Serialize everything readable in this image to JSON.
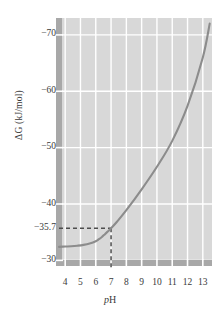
{
  "chart_data": {
    "type": "line",
    "title": "",
    "xlabel": "pH",
    "ylabel": "ΔG (kJ/mol)",
    "xlim": [
      3.4,
      13.6
    ],
    "ylim": [
      -29.0,
      -73.0
    ],
    "grid": true,
    "legend": null,
    "x_ticks": [
      4,
      5,
      6,
      7,
      8,
      9,
      10,
      11,
      12,
      13
    ],
    "x_tick_labels": [
      "4",
      "5",
      "6",
      "7",
      "8",
      "9",
      "10",
      "11",
      "12",
      "13"
    ],
    "y_ticks": [
      -70,
      -60,
      -50,
      -40,
      -35.7,
      -30
    ],
    "y_tick_labels": [
      "−70",
      "−60",
      "−50",
      "−40",
      "−35.7",
      "−30"
    ],
    "series": [
      {
        "name": "ΔG vs pH",
        "color": "#8c8c8c",
        "x": [
          3.6,
          4.0,
          4.4,
          4.8,
          5.2,
          5.6,
          6.0,
          6.2,
          6.4,
          6.6,
          6.8,
          7.0,
          7.4,
          8.0,
          9.0,
          10.0,
          11.0,
          12.0,
          13.0,
          13.45
        ],
        "y": [
          -32.4,
          -32.45,
          -32.5,
          -32.6,
          -32.75,
          -33.0,
          -33.4,
          -33.75,
          -34.15,
          -34.65,
          -35.15,
          -35.7,
          -36.9,
          -38.9,
          -42.6,
          -46.6,
          -51.2,
          -57.4,
          -66.0,
          -72.0
        ]
      }
    ],
    "annotations": [
      {
        "name": "ph7-marker",
        "type": "dashed-crosshair",
        "x": 7,
        "y": -35.7,
        "label": "−35.7",
        "color": "#4d4d4d"
      }
    ],
    "colors": {
      "plot_background": "#d8d8d8",
      "gridline": "#ffffff",
      "curve": "#8c8c8c",
      "axis_spine": "#a8a8a8",
      "text": "#3a3a3a",
      "page_background": "#ffffff"
    }
  },
  "axis": {
    "y_title": "ΔG (kJ/mol)",
    "x_title_italic": "p",
    "x_title_rest": "H"
  }
}
